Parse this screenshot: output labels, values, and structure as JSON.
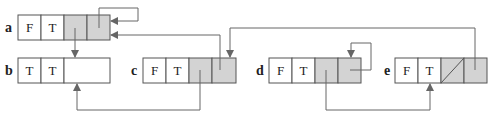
{
  "colors": {
    "white_cell": "#ffffff",
    "gray_cell": "#d3d3d3",
    "stroke": "#555555",
    "arrow": "#666666"
  },
  "nodes": [
    {
      "id": "a",
      "label": "a",
      "cells": [
        "F",
        "T",
        "",
        ""
      ]
    },
    {
      "id": "b",
      "label": "b",
      "cells": [
        "T",
        "T",
        ""
      ]
    },
    {
      "id": "c",
      "label": "c",
      "cells": [
        "F",
        "T",
        "",
        ""
      ]
    },
    {
      "id": "d",
      "label": "d",
      "cells": [
        "F",
        "T",
        "",
        ""
      ]
    },
    {
      "id": "e",
      "label": "e",
      "cells": [
        "F",
        "T",
        "",
        ""
      ]
    }
  ],
  "edges": [
    {
      "from": "a.cell4",
      "to": "a",
      "desc": "self-loop"
    },
    {
      "from": "a.cell3",
      "to": "b"
    },
    {
      "from": "c.cell4",
      "to": "a"
    },
    {
      "from": "c.cell3",
      "to": "b"
    },
    {
      "from": "e.cell4",
      "to": "c"
    },
    {
      "from": "d.cell4",
      "to": "d",
      "desc": "self-loop"
    },
    {
      "from": "d.cell3",
      "to": "e"
    },
    {
      "from": "e.cell3",
      "to": null,
      "desc": "null pointer (diagonal slash)"
    }
  ]
}
